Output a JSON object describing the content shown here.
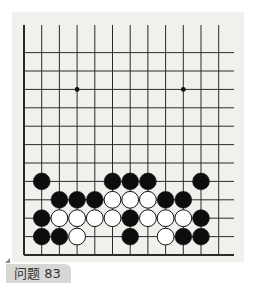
{
  "problem": {
    "label": "问题 83"
  },
  "board": {
    "background": "#f1f0ec",
    "line_color": "#2a2a2a",
    "columns": 12,
    "rows_visible": 12,
    "left_edge_visible": true,
    "bottom_edge_visible": true,
    "star_points": [
      {
        "col": 3,
        "row": 9
      },
      {
        "col": 9,
        "row": 9
      }
    ],
    "stones": [
      {
        "color": "black",
        "col": 1,
        "row": 4
      },
      {
        "color": "black",
        "col": 5,
        "row": 4
      },
      {
        "color": "black",
        "col": 6,
        "row": 4
      },
      {
        "color": "black",
        "col": 7,
        "row": 4
      },
      {
        "color": "black",
        "col": 10,
        "row": 4
      },
      {
        "color": "black",
        "col": 2,
        "row": 3
      },
      {
        "color": "black",
        "col": 3,
        "row": 3
      },
      {
        "color": "black",
        "col": 4,
        "row": 3
      },
      {
        "color": "white",
        "col": 5,
        "row": 3
      },
      {
        "color": "white",
        "col": 6,
        "row": 3
      },
      {
        "color": "white",
        "col": 7,
        "row": 3
      },
      {
        "color": "black",
        "col": 8,
        "row": 3
      },
      {
        "color": "black",
        "col": 9,
        "row": 3
      },
      {
        "color": "black",
        "col": 1,
        "row": 2
      },
      {
        "color": "white",
        "col": 2,
        "row": 2
      },
      {
        "color": "white",
        "col": 3,
        "row": 2
      },
      {
        "color": "white",
        "col": 4,
        "row": 2
      },
      {
        "color": "white",
        "col": 5,
        "row": 2
      },
      {
        "color": "black",
        "col": 6,
        "row": 2
      },
      {
        "color": "white",
        "col": 7,
        "row": 2
      },
      {
        "color": "white",
        "col": 8,
        "row": 2
      },
      {
        "color": "white",
        "col": 9,
        "row": 2
      },
      {
        "color": "black",
        "col": 10,
        "row": 2
      },
      {
        "color": "black",
        "col": 1,
        "row": 1
      },
      {
        "color": "black",
        "col": 2,
        "row": 1
      },
      {
        "color": "white",
        "col": 3,
        "row": 1
      },
      {
        "color": "black",
        "col": 6,
        "row": 1
      },
      {
        "color": "white",
        "col": 8,
        "row": 1
      },
      {
        "color": "black",
        "col": 9,
        "row": 1
      },
      {
        "color": "black",
        "col": 10,
        "row": 1
      }
    ]
  }
}
